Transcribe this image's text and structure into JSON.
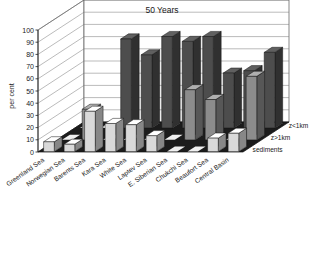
{
  "chart_data": {
    "type": "bar",
    "title": "50 Years",
    "xlabel": "",
    "ylabel": "per cent",
    "ylim": [
      0,
      100
    ],
    "ytick_step": 10,
    "yticks": [
      100,
      90,
      80,
      70,
      60,
      50,
      40,
      30,
      20,
      10,
      0
    ],
    "grid": true,
    "projection": "3d",
    "legend_position": "right-depth-axis",
    "categories": [
      "Greenland Sea",
      "Norwegian Sea",
      "Barents Sea",
      "Kara Sea",
      "White Sea",
      "Laptev Sea",
      "E. Siberian Sea",
      "Chukchi Sea",
      "Beaufort Sea",
      "Central Basin"
    ],
    "series": [
      {
        "name": "z<1km",
        "color": "#4d4d4d",
        "values": [
          0,
          0,
          73,
          60,
          75,
          71,
          75,
          45,
          47,
          62
        ]
      },
      {
        "name": "z>1km",
        "color": "#8c8c8c",
        "values": [
          0,
          25,
          0,
          0,
          0,
          0,
          41,
          33,
          0,
          52
        ]
      },
      {
        "name": "sediments",
        "color": "#d9d9d9",
        "values": [
          8,
          6,
          33,
          23,
          22,
          13,
          0,
          0,
          11,
          15
        ]
      }
    ]
  },
  "chart": {
    "title": "50 Years",
    "ylabel": "per cent",
    "yticks": [
      "100",
      "90",
      "80",
      "70",
      "60",
      "50",
      "40",
      "30",
      "20",
      "10",
      "0"
    ],
    "categories": [
      "Greenland Sea",
      "Norwegian Sea",
      "Barents Sea",
      "Kara Sea",
      "White Sea",
      "Laptev Sea",
      "E. Siberian Sea",
      "Chukchi Sea",
      "Beaufort Sea",
      "Central Basin"
    ],
    "series_labels": [
      "z<1km",
      "z>1km",
      "sediments"
    ]
  }
}
